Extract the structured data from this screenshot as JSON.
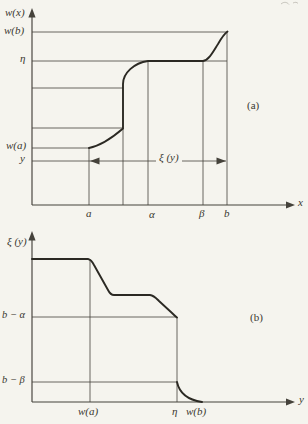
{
  "figure_type": "scanned textbook figure: nondecreasing function w(x) and its rearrangement/distribution function ξ(y)",
  "colors": {
    "paper": "#f5f4ee",
    "ink": "#45423b",
    "curve_ink": "#2b2923",
    "text": "#3a382f"
  },
  "panel_a": {
    "tag": "(a)",
    "y_axis_title": "w(x)",
    "x_axis_title": "x",
    "span_label": "ξ (y)",
    "ticks": {
      "wb": "w(b)",
      "eta": "η",
      "wa": "w(a)",
      "y": "y",
      "a": "a",
      "alpha": "α",
      "beta": "β",
      "b": "b"
    },
    "paths": {
      "axes": "M32,205 L32,14 M32,205 L288,205",
      "grid": "M32,32 H227 M32,61 H227 M32,88 H123 M32,128 H123 M32,148 H89 M89,148 V205 M123,128 V205 M148,61 V205 M203,61 V205 M227,32 V205",
      "span_line": "M32,161 H226",
      "curve": "M89,148 C99,146 112,138 123,128.5 L123,84 C123,73 134,63 148,61 L203,61 C209,60 213,52 218,44 C222,37 224,34 227.5,31.5",
      "arrow_up": "M32,8 L28.4,17.5 L35.6,17.5 Z",
      "arrow_right": "M295,205 L286,201.6 L286,208.4 Z",
      "span_arrow_left": "M90,161 L99.5,157.6 L99.5,164.4 Z",
      "span_arrow_right": "M226,161 L216.5,157.6 L216.5,164.4 Z"
    }
  },
  "panel_b": {
    "tag": "(b)",
    "y_axis_title": "ξ (y)",
    "x_axis_title": "y",
    "ticks": {
      "balpha": "b − α",
      "bbeta": "b − β",
      "wa": "w(a)",
      "eta": "η",
      "wb": "w(b)"
    },
    "paths": {
      "axes": "M32,402 L32,238 M32,402 L288,402",
      "grid": "M32,317 H177 M32,382 H177 M90,259 V402 M177,317 V402",
      "curve": "M32,259 L88,259 C91,259.5 92.5,262 94,265 L108,290 C109.5,293 111,295 114,295 L150,295 C154,295.5 156,298 159,301 L172,313 C174,315 175.5,316.5 177,317.5 M177,382 C179,391.5 185.5,399.5 202,402",
      "arrow_up": "M32,231 L28.4,240.5 L35.6,240.5 Z",
      "arrow_right": "M295,402 L286,398.6 L286,405.4 Z"
    }
  },
  "scan_artifact_path": "M281,4 c3,-2.5 6,-2 8,0.5 M293,3 c2,-1 4,-1 5,0.5",
  "chart_data": [
    {
      "type": "line",
      "panel": "(a)",
      "title": "nondecreasing function w(x) on [a, b]",
      "xlabel": "x",
      "ylabel": "w(x)",
      "x_ticks": [
        "a",
        "α",
        "β",
        "b"
      ],
      "y_ticks_top_to_bottom": [
        "w(b)",
        "η",
        "(unlabeled upper jump level)",
        "(unlabeled lower jump level)",
        "w(a)",
        "y"
      ],
      "grid": "droplines from curve breakpoints only",
      "legend": "none",
      "series": [
        {
          "name": "w(x)",
          "shape": "nondecreasing",
          "breakpoints": [
            {
              "x": "a",
              "y": "w(a)",
              "note": "curve starts on w(a) level"
            },
            {
              "x": "unlabeled jump abscissa between a and α",
              "y": "lower unlabeled level",
              "note": "smooth rise from a"
            },
            {
              "x": "same jump abscissa",
              "y": "upper unlabeled level",
              "note": "vertical jump discontinuity"
            },
            {
              "x": "α",
              "y": "η",
              "note": "concave bend up to level η"
            },
            {
              "x": "β",
              "y": "η",
              "note": "constant on [α, β]"
            },
            {
              "x": "b",
              "y": "w(b)",
              "note": "S-shaped rise to maximum w(b)"
            }
          ]
        }
      ],
      "annotations": [
        {
          "text": "ξ (y)",
          "type": "double-headed horizontal arrow",
          "from_x": "a",
          "to_x": "b",
          "at_level": "y (drawn just below w(a))"
        }
      ]
    },
    {
      "type": "line",
      "panel": "(b)",
      "title": "ξ(y): measure of {x : w(x) > y}",
      "xlabel": "y",
      "ylabel": "ξ (y)",
      "x_ticks": [
        "w(a)",
        "η",
        "w(b)"
      ],
      "y_ticks": [
        "b − α",
        "b − β"
      ],
      "grid": "droplines at w(a) and η; horizontal lines at b − α and b − β",
      "legend": "none",
      "series": [
        {
          "name": "ξ(y)",
          "shape": "nonincreasing",
          "breakpoints": [
            {
              "x": "0",
              "y": "b − a (unlabeled maximum plateau)",
              "note": "flat from axis to w(a)"
            },
            {
              "x": "w(a)",
              "y": "b − a",
              "note": "end of top plateau"
            },
            {
              "x": "just above w(a)",
              "y": "middle plateau (unlabeled)",
              "note": "steep straight descent"
            },
            {
              "x": "plateau ends",
              "y": "middle plateau",
              "note": "flat section caused by jump of w"
            },
            {
              "x": "η",
              "y": "b − α",
              "note": "gentle straight descent"
            },
            {
              "x": "η",
              "y": "b − β",
              "note": "vertical drop (w constant on [α, β])"
            },
            {
              "x": "w(b)",
              "y": "0",
              "note": "concave tail meeting the y-axis tangentially"
            }
          ]
        }
      ]
    }
  ]
}
